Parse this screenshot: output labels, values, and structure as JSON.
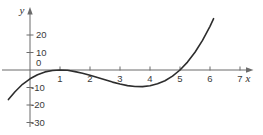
{
  "figure": {
    "background": "#ffffff",
    "axis_color": "#6b6b6b",
    "tick_color": "#6b6b6b",
    "curve_color": "#2d2d2d",
    "label_color": "#3a3a3a"
  },
  "chart_data": {
    "type": "line",
    "title": "",
    "xlabel": "x",
    "ylabel": "y",
    "x_ticks": [
      1,
      2,
      3,
      4,
      5,
      6,
      7
    ],
    "y_ticks": [
      20,
      10,
      0,
      -10,
      -20,
      -30
    ],
    "xlim": [
      -0.9,
      7.45
    ],
    "ylim": [
      -33,
      36
    ],
    "grid": false,
    "legend": false,
    "x_intercepts": [
      1,
      5
    ],
    "local_max": [
      1,
      0
    ],
    "local_min": [
      3.67,
      -9.5
    ],
    "series": [
      {
        "name": "cubic-curve",
        "points": [
          [
            -0.72,
            -16.9
          ],
          [
            -0.5,
            -12.4
          ],
          [
            -0.25,
            -8.2
          ],
          [
            0,
            -5
          ],
          [
            0.25,
            -2.7
          ],
          [
            0.5,
            -1.1
          ],
          [
            0.75,
            -0.3
          ],
          [
            1,
            0
          ],
          [
            1.25,
            -0.2
          ],
          [
            1.5,
            -0.9
          ],
          [
            1.75,
            -1.8
          ],
          [
            2,
            -3
          ],
          [
            2.25,
            -4.3
          ],
          [
            2.5,
            -5.6
          ],
          [
            2.75,
            -6.9
          ],
          [
            3,
            -8
          ],
          [
            3.25,
            -8.9
          ],
          [
            3.5,
            -9.4
          ],
          [
            3.75,
            -9.5
          ],
          [
            4,
            -9
          ],
          [
            4.25,
            -7.9
          ],
          [
            4.5,
            -6.1
          ],
          [
            4.75,
            -3.5
          ],
          [
            5,
            0
          ],
          [
            5.25,
            4.5
          ],
          [
            5.5,
            10.1
          ],
          [
            5.75,
            16.9
          ],
          [
            6,
            25
          ],
          [
            6.12,
            29.4
          ]
        ]
      }
    ]
  }
}
